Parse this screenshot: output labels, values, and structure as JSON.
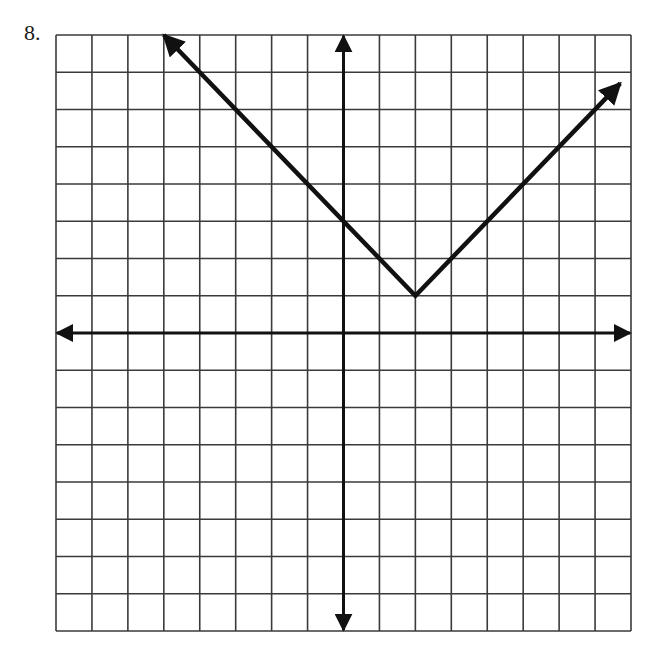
{
  "problem": {
    "number_label": "8."
  },
  "chart_data": {
    "type": "line",
    "title": "",
    "xlabel": "",
    "ylabel": "",
    "xlim": [
      -8,
      8
    ],
    "ylim": [
      -8,
      8
    ],
    "grid": true,
    "grid_step": 1,
    "axes_arrows": true,
    "function": "y = |x - 2| + 1",
    "vertex": [
      2,
      1
    ],
    "series": [
      {
        "name": "absolute value graph",
        "x": [
          -5,
          2,
          7.7
        ],
        "y": [
          8,
          1,
          6.7
        ],
        "arrows": [
          "start",
          "end"
        ]
      }
    ]
  },
  "layout": {
    "grid_left": 56,
    "grid_top": 35,
    "grid_right": 631,
    "grid_bottom": 631,
    "cols": 16,
    "rows": 16,
    "origin_col": 8,
    "origin_row": 8,
    "line_color": "#111111",
    "grid_color": "#3a3a3a"
  }
}
